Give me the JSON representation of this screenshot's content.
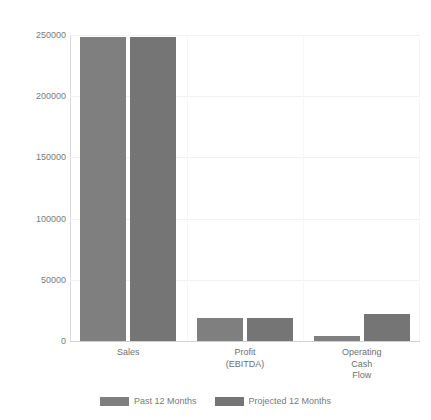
{
  "chart_data": {
    "type": "bar",
    "title": "",
    "subtitle": "",
    "xlabel": "",
    "ylabel": "",
    "categories": [
      "Sales",
      "Profit\n(EBITDA)",
      "Operating\nCash\nFlow"
    ],
    "series": [
      {
        "name": "Past 12 Months",
        "values": [
          248000,
          19000,
          4000
        ],
        "color": "#7f7f7f"
      },
      {
        "name": "Projected 12 Months",
        "values": [
          248000,
          19000,
          22000
        ],
        "color": "#757575"
      }
    ],
    "ylim": [
      0,
      250000
    ],
    "yticks": [
      0,
      50000,
      100000,
      150000,
      200000,
      250000
    ],
    "ytick_labels": [
      "0",
      "50000",
      "100000",
      "150000",
      "200000",
      "250000"
    ],
    "grid": true,
    "grid_axis": "both",
    "legend_position": "bottom-center",
    "background_color": "#ffffff",
    "axis_color": "#d0d0d0",
    "gridline_color": "#f2f2f2",
    "tick_label_color": "#7a7a7a"
  }
}
